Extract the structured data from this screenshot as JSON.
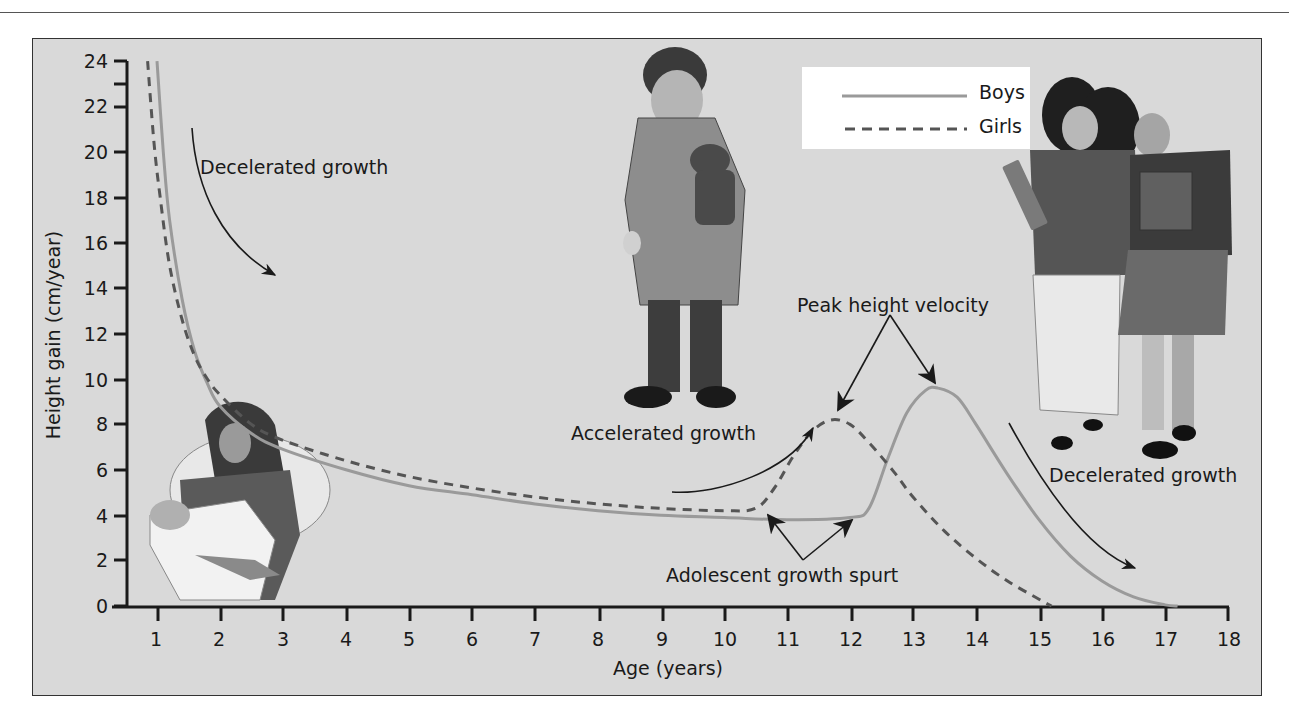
{
  "chart_data": {
    "type": "line",
    "title": "",
    "xlabel": "Age (years)",
    "ylabel": "Height gain (cm/year)",
    "xlim": [
      0.5,
      18
    ],
    "ylim": [
      0,
      24
    ],
    "x_ticks": [
      1,
      2,
      3,
      4,
      5,
      6,
      7,
      8,
      9,
      10,
      11,
      12,
      13,
      14,
      15,
      16,
      17,
      18
    ],
    "y_ticks": [
      0,
      2,
      4,
      6,
      8,
      10,
      12,
      14,
      16,
      18,
      20,
      22,
      24
    ],
    "grid": false,
    "legend_position": "top-right (inset)",
    "series": [
      {
        "name": "Boys",
        "style": "solid",
        "color": "#9a9a9a",
        "points": [
          [
            1.0,
            24.0
          ],
          [
            1.1,
            20.0
          ],
          [
            1.2,
            17.0
          ],
          [
            1.4,
            13.5
          ],
          [
            1.6,
            11.2
          ],
          [
            1.8,
            9.8
          ],
          [
            2.0,
            8.8
          ],
          [
            2.5,
            7.6
          ],
          [
            3,
            6.9
          ],
          [
            4,
            6.0
          ],
          [
            5,
            5.3
          ],
          [
            6,
            4.9
          ],
          [
            7,
            4.5
          ],
          [
            8,
            4.2
          ],
          [
            9,
            4.0
          ],
          [
            10,
            3.9
          ],
          [
            11,
            3.8
          ],
          [
            12,
            3.9
          ],
          [
            12.3,
            4.3
          ],
          [
            12.6,
            6.5
          ],
          [
            12.9,
            8.5
          ],
          [
            13.2,
            9.5
          ],
          [
            13.4,
            9.6
          ],
          [
            13.7,
            9.2
          ],
          [
            14.0,
            8.0
          ],
          [
            14.5,
            5.8
          ],
          [
            15.0,
            3.8
          ],
          [
            15.5,
            2.2
          ],
          [
            16.0,
            1.1
          ],
          [
            16.5,
            0.4
          ],
          [
            17.0,
            0.05
          ],
          [
            17.2,
            0.0
          ]
        ]
      },
      {
        "name": "Girls",
        "style": "dashed",
        "color": "#555555",
        "points": [
          [
            0.85,
            24.0
          ],
          [
            0.95,
            20.5
          ],
          [
            1.05,
            18.0
          ],
          [
            1.2,
            15.0
          ],
          [
            1.4,
            12.6
          ],
          [
            1.6,
            11.0
          ],
          [
            1.8,
            10.0
          ],
          [
            2.0,
            9.3
          ],
          [
            2.5,
            8.0
          ],
          [
            3,
            7.3
          ],
          [
            4,
            6.4
          ],
          [
            5,
            5.7
          ],
          [
            6,
            5.2
          ],
          [
            7,
            4.8
          ],
          [
            8,
            4.5
          ],
          [
            9,
            4.3
          ],
          [
            10,
            4.2
          ],
          [
            10.5,
            4.3
          ],
          [
            10.8,
            5.2
          ],
          [
            11.1,
            6.6
          ],
          [
            11.4,
            7.7
          ],
          [
            11.7,
            8.2
          ],
          [
            12.0,
            8.0
          ],
          [
            12.3,
            7.2
          ],
          [
            12.7,
            5.9
          ],
          [
            13.0,
            4.8
          ],
          [
            13.5,
            3.3
          ],
          [
            14.0,
            2.1
          ],
          [
            14.5,
            1.1
          ],
          [
            15.0,
            0.3
          ],
          [
            15.2,
            0.0
          ]
        ]
      }
    ],
    "annotations": [
      {
        "text": "Decelerated growth",
        "near": [
          1.8,
          19.3
        ]
      },
      {
        "text": "Accelerated growth",
        "near": [
          8.5,
          7.6
        ]
      },
      {
        "text": "Peak height velocity",
        "near": [
          12.2,
          13.2
        ],
        "points_to": [
          "Girls peak (~11.7, 8.2)",
          "Boys peak (~13.4, 9.6)"
        ]
      },
      {
        "text": "Adolescent growth spurt",
        "near": [
          11.0,
          1.3
        ],
        "points_to": [
          "Girls spurt onset (~10.6, 4.2)",
          "Boys spurt onset (~12.0, 4.0)"
        ]
      },
      {
        "text": "Decelerated growth",
        "near": [
          16.6,
          6.4
        ]
      }
    ],
    "illustrations": [
      "mother holding infant",
      "boy in bathrobe holding teddy bear",
      "two adolescent girls carrying books"
    ]
  },
  "legend": {
    "items": [
      {
        "label": "Boys",
        "style": "solid",
        "color": "#9a9a9a"
      },
      {
        "label": "Girls",
        "style": "dashed",
        "color": "#555555"
      }
    ]
  },
  "axes": {
    "xlabel": "Age (years)",
    "ylabel": "Height gain (cm/year)"
  },
  "annotations": {
    "decel_early": "Decelerated growth",
    "accel": "Accelerated growth",
    "peak": "Peak height velocity",
    "spurt": "Adolescent growth spurt",
    "decel_late": "Decelerated growth"
  }
}
